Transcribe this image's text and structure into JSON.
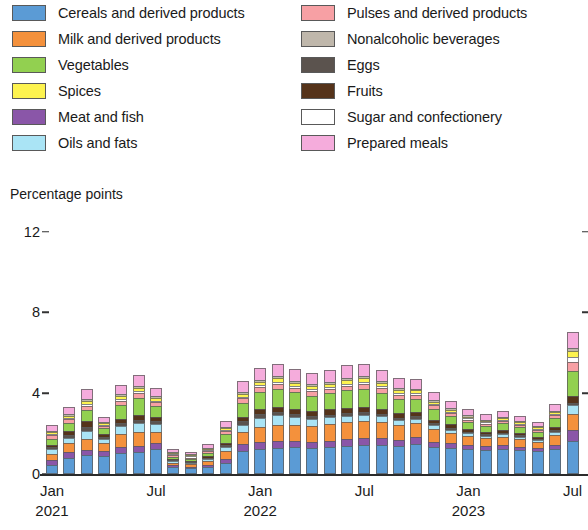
{
  "axis_title": "Percentage points",
  "legend": {
    "left": [
      {
        "label": "Cereals and derived products",
        "color": "#5b9bd5",
        "key": "cereals"
      },
      {
        "label": "Milk and derived products",
        "color": "#f4913c",
        "key": "milk"
      },
      {
        "label": "Vegetables",
        "color": "#92d050",
        "key": "vegetables"
      },
      {
        "label": "Spices",
        "color": "#fdf34f",
        "key": "spices"
      },
      {
        "label": "Meat and fish",
        "color": "#8a56a8",
        "key": "meat_fish"
      },
      {
        "label": "Oils and fats",
        "color": "#aae4f5",
        "key": "oils_fats"
      }
    ],
    "right": [
      {
        "label": "Pulses and derived products",
        "color": "#f7a0a4",
        "key": "pulses"
      },
      {
        "label": "Nonalcoholic beverages",
        "color": "#bfb7ab",
        "key": "nonalc_bev"
      },
      {
        "label": "Eggs",
        "color": "#5b534e",
        "key": "eggs"
      },
      {
        "label": "Fruits",
        "color": "#55331a",
        "key": "fruits"
      },
      {
        "label": "Sugar and confectionery",
        "color": "#ffffff",
        "key": "sugar"
      },
      {
        "label": "Prepared meals",
        "color": "#f5acdc",
        "key": "prepared"
      }
    ]
  },
  "yaxis": {
    "ticks": [
      "0",
      "4",
      "8",
      "12"
    ],
    "values": [
      0,
      4,
      8,
      12
    ],
    "min": 0,
    "max": 12
  },
  "xaxis": {
    "labels": [
      {
        "month": "Jan",
        "year": "2021",
        "index": 0
      },
      {
        "month": "Jul",
        "year": "",
        "index": 6
      },
      {
        "month": "Jan",
        "year": "2022",
        "index": 12
      },
      {
        "month": "Jul",
        "year": "",
        "index": 18
      },
      {
        "month": "Jan",
        "year": "2023",
        "index": 24
      },
      {
        "month": "Jul",
        "year": "",
        "index": 30
      }
    ]
  },
  "chart_data": {
    "type": "bar",
    "stacked": true,
    "title": "",
    "subtitle": "",
    "xlabel": "",
    "ylabel": "Percentage points",
    "ylim": [
      0,
      12
    ],
    "grid": false,
    "legend_position": "top",
    "categories": [
      "Jan 2021",
      "Feb 2021",
      "Mar 2021",
      "Apr 2021",
      "May 2021",
      "Jun 2021",
      "Jul 2021",
      "Aug 2021",
      "Sep 2021",
      "Oct 2021",
      "Nov 2021",
      "Dec 2021",
      "Jan 2022",
      "Feb 2022",
      "Mar 2022",
      "Apr 2022",
      "May 2022",
      "Jun 2022",
      "Jul 2022",
      "Aug 2022",
      "Sep 2022",
      "Oct 2022",
      "Nov 2022",
      "Dec 2022",
      "Jan 2023",
      "Feb 2023",
      "Mar 2023",
      "Apr 2023",
      "May 2023",
      "Jun 2023",
      "Jul 2023"
    ],
    "series": [
      {
        "name": "Cereals and derived products",
        "color": "#5b9bd5",
        "values": [
          0.45,
          0.8,
          0.95,
          0.9,
          1.05,
          1.1,
          1.25,
          0.35,
          0.3,
          0.35,
          0.55,
          1.15,
          1.25,
          1.3,
          1.35,
          1.3,
          1.35,
          1.4,
          1.45,
          1.45,
          1.4,
          1.5,
          1.35,
          1.3,
          1.25,
          1.2,
          1.25,
          1.2,
          1.15,
          1.25,
          1.65
        ]
      },
      {
        "name": "Meat and fish",
        "color": "#8a56a8",
        "values": [
          0.25,
          0.28,
          0.25,
          0.22,
          0.3,
          0.3,
          0.28,
          0.08,
          0.06,
          0.1,
          0.18,
          0.32,
          0.35,
          0.35,
          0.3,
          0.28,
          0.3,
          0.32,
          0.35,
          0.32,
          0.3,
          0.32,
          0.25,
          0.22,
          0.2,
          0.18,
          0.18,
          0.15,
          0.14,
          0.2,
          0.55
        ]
      },
      {
        "name": "Milk and derived products",
        "color": "#f4913c",
        "values": [
          0.3,
          0.45,
          0.55,
          0.4,
          0.62,
          0.7,
          0.55,
          0.12,
          0.12,
          0.2,
          0.4,
          0.6,
          0.72,
          0.8,
          0.8,
          0.8,
          0.85,
          0.85,
          0.82,
          0.8,
          0.72,
          0.7,
          0.62,
          0.5,
          0.42,
          0.38,
          0.42,
          0.38,
          0.32,
          0.5,
          0.75
        ]
      },
      {
        "name": "Oils and fats",
        "color": "#aae4f5",
        "values": [
          0.22,
          0.25,
          0.4,
          0.22,
          0.4,
          0.42,
          0.38,
          0.08,
          0.06,
          0.1,
          0.2,
          0.38,
          0.45,
          0.45,
          0.38,
          0.35,
          0.32,
          0.3,
          0.32,
          0.28,
          0.25,
          0.22,
          0.2,
          0.18,
          0.14,
          0.12,
          0.12,
          0.1,
          0.08,
          0.12,
          0.45
        ]
      },
      {
        "name": "Eggs",
        "color": "#5b534e",
        "values": [
          0.12,
          0.14,
          0.18,
          0.1,
          0.14,
          0.16,
          0.15,
          0.05,
          0.05,
          0.06,
          0.1,
          0.16,
          0.18,
          0.16,
          0.14,
          0.12,
          0.12,
          0.14,
          0.14,
          0.12,
          0.12,
          0.12,
          0.1,
          0.1,
          0.08,
          0.08,
          0.08,
          0.08,
          0.07,
          0.1,
          0.12
        ]
      },
      {
        "name": "Fruits",
        "color": "#55331a",
        "values": [
          0.1,
          0.22,
          0.28,
          0.12,
          0.22,
          0.26,
          0.22,
          0.05,
          0.04,
          0.06,
          0.12,
          0.22,
          0.28,
          0.28,
          0.26,
          0.25,
          0.26,
          0.28,
          0.26,
          0.24,
          0.22,
          0.2,
          0.18,
          0.16,
          0.14,
          0.12,
          0.12,
          0.1,
          0.09,
          0.14,
          0.35
        ]
      },
      {
        "name": "Vegetables",
        "color": "#92d050",
        "values": [
          0.32,
          0.4,
          0.55,
          0.3,
          0.7,
          0.85,
          0.55,
          0.12,
          0.1,
          0.18,
          0.42,
          0.7,
          0.82,
          0.88,
          0.82,
          0.78,
          0.8,
          0.85,
          0.88,
          0.82,
          0.72,
          0.66,
          0.52,
          0.42,
          0.35,
          0.3,
          0.35,
          0.32,
          0.25,
          0.45,
          1.25
        ]
      },
      {
        "name": "Pulses and derived products",
        "color": "#f7a0a4",
        "values": [
          0.15,
          0.18,
          0.22,
          0.12,
          0.2,
          0.22,
          0.18,
          0.06,
          0.05,
          0.08,
          0.14,
          0.22,
          0.24,
          0.24,
          0.22,
          0.22,
          0.22,
          0.24,
          0.24,
          0.22,
          0.2,
          0.2,
          0.18,
          0.15,
          0.12,
          0.12,
          0.12,
          0.1,
          0.09,
          0.14,
          0.45
        ]
      },
      {
        "name": "Sugar and confectionery",
        "color": "#ffffff",
        "values": [
          0.05,
          0.06,
          0.08,
          0.04,
          0.08,
          0.08,
          0.07,
          0.02,
          0.02,
          0.03,
          0.05,
          0.08,
          0.1,
          0.1,
          0.09,
          0.09,
          0.09,
          0.1,
          0.1,
          0.09,
          0.08,
          0.08,
          0.07,
          0.06,
          0.05,
          0.05,
          0.05,
          0.04,
          0.04,
          0.06,
          0.22
        ]
      },
      {
        "name": "Spices",
        "color": "#fdf34f",
        "values": [
          0.1,
          0.12,
          0.16,
          0.08,
          0.15,
          0.16,
          0.14,
          0.04,
          0.03,
          0.05,
          0.1,
          0.16,
          0.18,
          0.18,
          0.16,
          0.16,
          0.16,
          0.18,
          0.18,
          0.16,
          0.15,
          0.14,
          0.12,
          0.1,
          0.09,
          0.08,
          0.08,
          0.07,
          0.06,
          0.1,
          0.32
        ]
      },
      {
        "name": "Nonalcoholic beverages",
        "color": "#bfb7ab",
        "values": [
          0.06,
          0.07,
          0.09,
          0.05,
          0.09,
          0.09,
          0.08,
          0.02,
          0.02,
          0.03,
          0.06,
          0.09,
          0.1,
          0.1,
          0.1,
          0.09,
          0.09,
          0.1,
          0.1,
          0.09,
          0.09,
          0.08,
          0.07,
          0.06,
          0.05,
          0.05,
          0.05,
          0.04,
          0.04,
          0.06,
          0.12
        ]
      },
      {
        "name": "Prepared meals",
        "color": "#f5acdc",
        "values": [
          0.28,
          0.35,
          0.48,
          0.25,
          0.45,
          0.55,
          0.42,
          0.12,
          0.1,
          0.16,
          0.3,
          0.52,
          0.58,
          0.62,
          0.58,
          0.55,
          0.58,
          0.62,
          0.62,
          0.58,
          0.52,
          0.48,
          0.42,
          0.35,
          0.3,
          0.28,
          0.28,
          0.25,
          0.22,
          0.35,
          0.82
        ]
      }
    ],
    "totals": [
      2.4,
      3.32,
      4.19,
      2.8,
      4.4,
      4.89,
      4.27,
      1.11,
      0.95,
      1.4,
      2.62,
      4.6,
      5.25,
      5.46,
      5.2,
      4.99,
      5.14,
      5.38,
      5.46,
      5.17,
      4.77,
      4.7,
      4.08,
      3.6,
      3.19,
      2.96,
      3.1,
      2.83,
      2.55,
      3.47,
      7.05
    ]
  }
}
